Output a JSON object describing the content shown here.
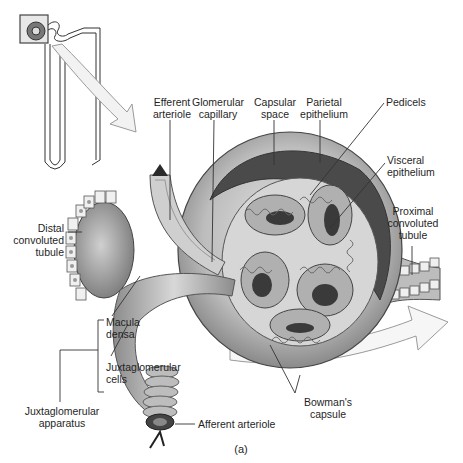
{
  "figure": {
    "panel_label": "(a)",
    "inset": {
      "description": "Nephron overview with boxed renal corpuscle and arrow pointing to enlarged view"
    }
  },
  "labels": {
    "efferent_arteriole": "Efferent\narteriole",
    "glomerular_capillary": "Glomerular\ncapillary",
    "capsular_space": "Capsular\nspace",
    "parietal_epithelium": "Parietal\nepithelium",
    "pedicels": "Pedicels",
    "visceral_epithelium": "Visceral\nepithelium",
    "proximal_convoluted_tubule": "Proximal\nconvoluted\ntubule",
    "distal_convoluted_tubule": "Distal\nconvoluted\ntubule",
    "macula_densa": "Macula\ndensa",
    "juxtaglomerular_cells": "Juxtaglomerular\ncells",
    "juxtaglomerular_apparatus": "Juxtaglomerular\napparatus",
    "afferent_arteriole": "Afferent arteriole",
    "bowmans_capsule": "Bowman's\ncapsule"
  },
  "colors": {
    "line": "#333333",
    "tissue_light": "#d9d9d9",
    "tissue_mid": "#a8a8a8",
    "tissue_dark": "#4a4a4a",
    "arrow_fill": "#f4f4f4"
  }
}
